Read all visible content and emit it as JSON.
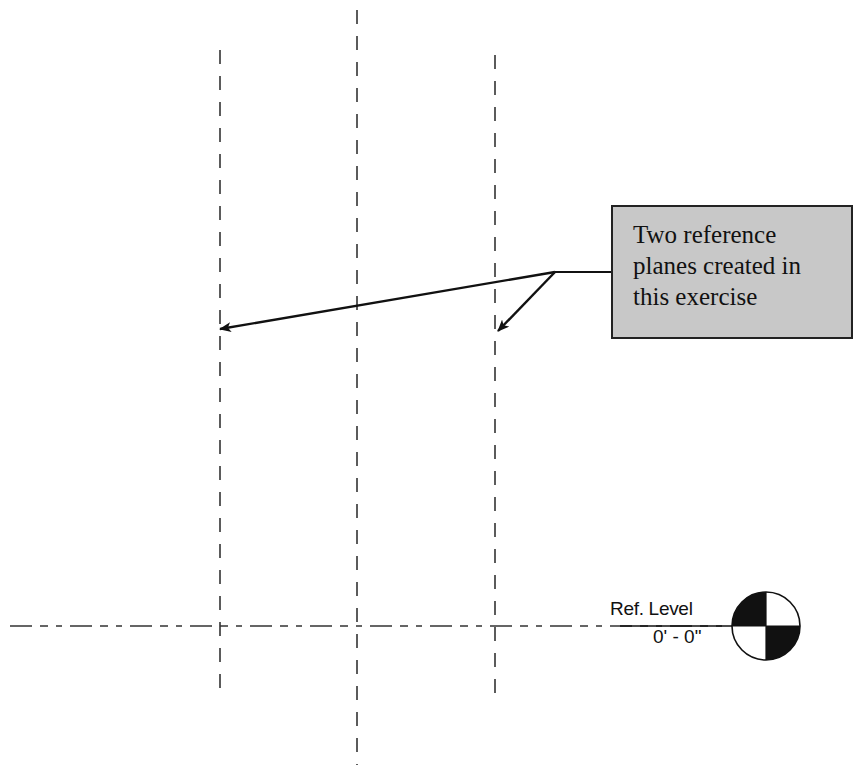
{
  "diagram": {
    "callout": {
      "lines": [
        "Two reference",
        "planes created in",
        "this exercise"
      ],
      "background": "#c8c8c8",
      "border": "#222222"
    },
    "level": {
      "name": "Ref. Level",
      "elevation": "0' - 0\""
    },
    "reference_planes": [
      {
        "id": "left-plane",
        "x": 220,
        "y_top": 50,
        "y_bottom": 695,
        "highlighted": true
      },
      {
        "id": "center-plane",
        "x": 357,
        "y_top": 10,
        "y_bottom": 765,
        "highlighted": false
      },
      {
        "id": "right-plane",
        "x": 495,
        "y_top": 55,
        "y_bottom": 700,
        "highlighted": true
      }
    ],
    "level_line": {
      "y": 626,
      "x_start": 10,
      "x_end": 730
    },
    "leader": {
      "origin": {
        "x": 555,
        "y": 272
      },
      "box_attach": {
        "x": 611,
        "y": 272
      },
      "targets": [
        {
          "x": 218,
          "y": 330
        },
        {
          "x": 497,
          "y": 330
        }
      ]
    },
    "line_color": "#222222"
  }
}
